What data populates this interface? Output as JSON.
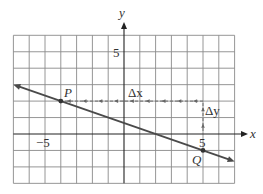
{
  "figure": {
    "type": "coordinate-plane-line",
    "axes": {
      "x_label": "x",
      "y_label": "y",
      "x_range": [
        -7,
        7
      ],
      "y_range": [
        -3,
        6
      ],
      "grid_step": 1,
      "tick_labels": {
        "x_neg": "−5",
        "x_pos": "5",
        "y_pos": "5"
      }
    },
    "line": {
      "slope": "-1/3",
      "passes_through": [
        [
          -4,
          2
        ],
        [
          5,
          -1
        ]
      ],
      "arrows": "both-ends"
    },
    "points": [
      {
        "name": "P",
        "x": -4,
        "y": 2
      },
      {
        "name": "Q",
        "x": 5,
        "y": -1
      }
    ],
    "annotations": {
      "delta_x_label": "Δx",
      "delta_y_label": "Δy",
      "delta_x_from": [
        5,
        2
      ],
      "delta_x_to": [
        -4,
        2
      ],
      "delta_y_from": [
        5,
        -1
      ],
      "delta_y_to": [
        5,
        2
      ]
    },
    "colors": {
      "grid": "#8a8a8a",
      "axis": "#222222",
      "line": "#4a4a4a",
      "dotted": "#666666",
      "background": "#ffffff"
    }
  }
}
